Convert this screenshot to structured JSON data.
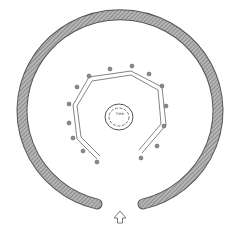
{
  "diagram": {
    "type": "site-plan",
    "center_label": "tree",
    "entrance_marker": "arrow-up",
    "colors": {
      "outer_ring": "#9a9a9a",
      "stroke": "#555555",
      "posts": "#7a7a7a"
    }
  }
}
